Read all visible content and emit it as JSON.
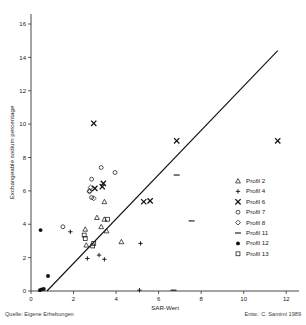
{
  "figure": {
    "title_partial": "",
    "source_note": "Quelle: Eigene Erhebungen",
    "author_note": "Entw.: C. Samimi 1989"
  },
  "chart_data": {
    "type": "scatter",
    "title": "",
    "xlabel": "SAR-Wert",
    "ylabel": "Exchangeable sodium percentage",
    "xlim": [
      0,
      12.6
    ],
    "ylim": [
      0,
      16.6
    ],
    "xticks": [
      0,
      2,
      4,
      6,
      8,
      10,
      12
    ],
    "yticks": [
      0,
      2,
      4,
      6,
      8,
      10,
      12,
      14,
      16
    ],
    "xticklabels": [
      "0",
      "2",
      "4",
      "6",
      "8",
      "10",
      "12"
    ],
    "yticklabels": [
      "0",
      "2",
      "4",
      "6",
      "8",
      "10",
      "12",
      "14",
      "16"
    ],
    "grid": false,
    "legend_position": "right",
    "trendline": {
      "x0": 0.75,
      "y0": 0.0,
      "x1": 11.6,
      "y1": 14.4,
      "style": "solid"
    },
    "series": [
      {
        "name": "Profil 2",
        "marker": "triangle",
        "filled": false,
        "points": [
          [
            3.1,
            4.4
          ],
          [
            3.3,
            3.85
          ],
          [
            3.55,
            3.6
          ],
          [
            3.45,
            5.35
          ],
          [
            2.55,
            3.7
          ],
          [
            2.6,
            2.75
          ],
          [
            4.25,
            2.95
          ],
          [
            3.45,
            4.3
          ]
        ]
      },
      {
        "name": "Profil 4",
        "marker": "plus",
        "filled": true,
        "points": [
          [
            1.85,
            3.55
          ],
          [
            2.65,
            1.95
          ],
          [
            3.2,
            2.15
          ],
          [
            3.45,
            1.9
          ],
          [
            5.15,
            2.85
          ],
          [
            5.1,
            0.05
          ]
        ]
      },
      {
        "name": "Profil 6",
        "marker": "x",
        "filled": true,
        "points": [
          [
            2.95,
            10.05
          ],
          [
            3.0,
            6.15
          ],
          [
            3.35,
            6.25
          ],
          [
            3.4,
            6.45
          ],
          [
            5.3,
            5.35
          ],
          [
            5.6,
            5.4
          ],
          [
            6.85,
            9.0
          ],
          [
            11.6,
            9.0
          ]
        ]
      },
      {
        "name": "Profil 7",
        "marker": "circle",
        "filled": false,
        "points": [
          [
            1.5,
            3.85
          ],
          [
            2.85,
            6.7
          ],
          [
            3.3,
            7.4
          ],
          [
            3.95,
            7.1
          ],
          [
            2.75,
            6.0
          ],
          [
            2.85,
            5.6
          ]
        ]
      },
      {
        "name": "Profil 8",
        "marker": "diamond",
        "filled": false,
        "points": [
          [
            2.8,
            6.2
          ],
          [
            2.75,
            5.95
          ],
          [
            2.95,
            5.55
          ]
        ]
      },
      {
        "name": "Profil 11",
        "marker": "dash",
        "filled": true,
        "points": [
          [
            6.85,
            6.95
          ],
          [
            7.55,
            4.2
          ],
          [
            6.7,
            0.05
          ]
        ]
      },
      {
        "name": "Profil 12",
        "marker": "circle",
        "filled": true,
        "points": [
          [
            0.45,
            3.65
          ],
          [
            0.8,
            0.9
          ],
          [
            0.5,
            0.1
          ],
          [
            0.6,
            0.12
          ],
          [
            0.42,
            0.05
          ]
        ]
      },
      {
        "name": "Profil 13",
        "marker": "square",
        "filled": false,
        "points": [
          [
            2.5,
            3.35
          ],
          [
            2.55,
            3.15
          ],
          [
            2.95,
            2.85
          ],
          [
            2.9,
            2.7
          ],
          [
            3.6,
            4.3
          ]
        ]
      }
    ],
    "legend": [
      {
        "label": "Profil 2",
        "marker": "triangle",
        "filled": false
      },
      {
        "label": "Profil 4",
        "marker": "plus",
        "filled": true
      },
      {
        "label": "Profil 6",
        "marker": "x",
        "filled": true
      },
      {
        "label": "Profil 7",
        "marker": "circle",
        "filled": false
      },
      {
        "label": "Profil 8",
        "marker": "diamond",
        "filled": false
      },
      {
        "label": "Profil 11",
        "marker": "dash",
        "filled": true
      },
      {
        "label": "Profil 12",
        "marker": "circle",
        "filled": true
      },
      {
        "label": "Profil 13",
        "marker": "square",
        "filled": false
      }
    ]
  }
}
